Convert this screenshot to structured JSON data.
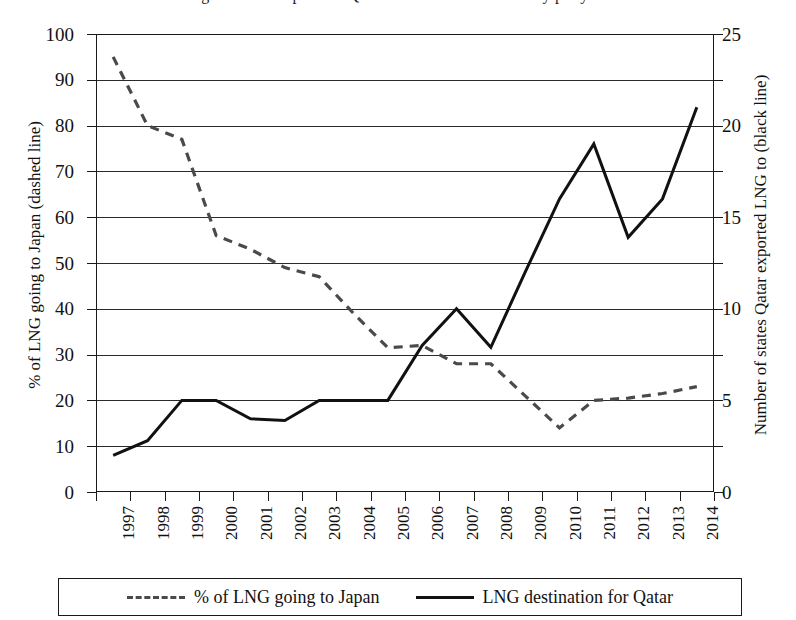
{
  "title": "Figure: LNG exports of Qatar and destination diversity per year",
  "legend": {
    "position": "bottom",
    "entries": [
      {
        "label": "% of LNG going to Japan",
        "style": "dashed",
        "color": "#4a4a4a"
      },
      {
        "label": "LNG destination for Qatar",
        "style": "solid",
        "color": "#111111"
      }
    ]
  },
  "axes": {
    "left": {
      "title": "% of LNG going to Japan (dashed line)",
      "ticks": [
        0,
        10,
        20,
        30,
        40,
        50,
        60,
        70,
        80,
        90,
        100
      ],
      "min": 0,
      "max": 100
    },
    "right": {
      "title": "Number of states Qatar exported LNG to (black line)",
      "ticks": [
        0,
        5,
        10,
        15,
        20,
        25
      ],
      "min": 0,
      "max": 25
    },
    "x": {
      "title": "",
      "labels": [
        "1997",
        "1998",
        "1999",
        "2000",
        "2001",
        "2002",
        "2003",
        "2004",
        "2005",
        "2006",
        "2007",
        "2008",
        "2009",
        "2010",
        "2011",
        "2012",
        "2013",
        "2014"
      ]
    }
  },
  "chart_data": {
    "type": "line",
    "title": "Figure: LNG exports of Qatar and destination diversity per year",
    "xlabel": "",
    "ylabel": "% of LNG going to Japan (dashed line)",
    "y2label": "Number of states Qatar exported LNG to (black line)",
    "ylim": [
      0,
      100
    ],
    "y2lim": [
      0,
      25
    ],
    "grid": true,
    "legend_position": "bottom",
    "categories": [
      "1997",
      "1998",
      "1999",
      "2000",
      "2001",
      "2002",
      "2003",
      "2004",
      "2005",
      "2006",
      "2007",
      "2008",
      "2009",
      "2010",
      "2011",
      "2012",
      "2013",
      "2014"
    ],
    "series": [
      {
        "name": "% of LNG going to Japan",
        "style": "dashed",
        "color": "#4a4a4a",
        "axis": "left",
        "unit": "%",
        "values": [
          95,
          80,
          77,
          56,
          53,
          49,
          47,
          39,
          31.5,
          32,
          28,
          28,
          21,
          14,
          20,
          20.5,
          21.5,
          23
        ]
      },
      {
        "name": "LNG destination for Qatar",
        "style": "solid",
        "color": "#111111",
        "axis": "right",
        "unit": "states",
        "values": [
          2,
          2.8,
          5,
          5,
          4,
          3.9,
          5,
          5,
          5,
          8,
          10,
          7.9,
          12,
          16,
          19,
          13.9,
          16,
          21
        ]
      }
    ]
  }
}
